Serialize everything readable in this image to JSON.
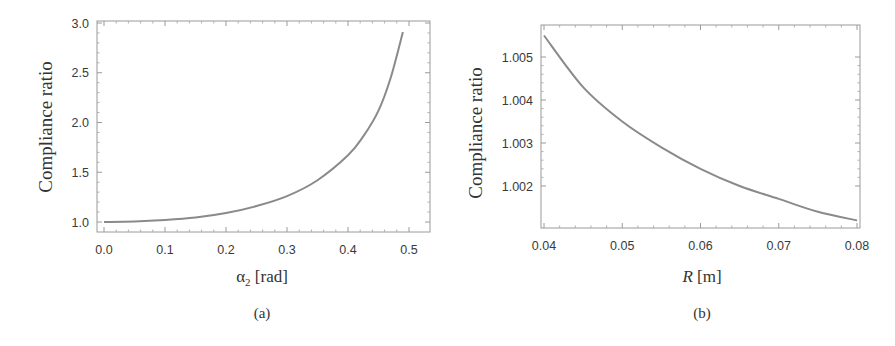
{
  "colors": {
    "curve": "#8a8a8a",
    "frame": "#9a9a9a",
    "text": "#333333",
    "background": "#ffffff"
  },
  "chart_data": [
    {
      "id": "a",
      "type": "line",
      "caption": "(a)",
      "title": "",
      "xlabel": "α₂ [rad]",
      "xlabel_base": "α",
      "xlabel_sub": "2",
      "xlabel_unit": " [rad]",
      "ylabel": "Compliance ratio",
      "xlim": [
        -0.01,
        0.535
      ],
      "ylim": [
        0.9,
        3.0
      ],
      "xticks": [
        "0.0",
        "0.1",
        "0.2",
        "0.3",
        "0.4",
        "0.5"
      ],
      "xtick_values": [
        0.0,
        0.1,
        0.2,
        0.3,
        0.4,
        0.5
      ],
      "yticks": [
        "1.0",
        "1.5",
        "2.0",
        "2.5",
        "3.0"
      ],
      "ytick_values": [
        1.0,
        1.5,
        2.0,
        2.5,
        3.0
      ],
      "grid": false,
      "legend": null,
      "series": [
        {
          "name": "Compliance ratio",
          "x": [
            0.0,
            0.05,
            0.1,
            0.15,
            0.2,
            0.25,
            0.3,
            0.35,
            0.4,
            0.425,
            0.45,
            0.47,
            0.49
          ],
          "y": [
            1.0,
            1.005,
            1.02,
            1.045,
            1.09,
            1.16,
            1.26,
            1.42,
            1.67,
            1.86,
            2.12,
            2.45,
            2.91
          ]
        }
      ]
    },
    {
      "id": "b",
      "type": "line",
      "caption": "(b)",
      "title": "",
      "xlabel": "R [m]",
      "xlabel_base": "R",
      "xlabel_sub": "",
      "xlabel_unit": " [m]",
      "ylabel": "Compliance ratio",
      "xlim": [
        0.0395,
        0.0805
      ],
      "ylim": [
        1.00105,
        1.00572
      ],
      "xticks": [
        "0.04",
        "0.05",
        "0.06",
        "0.07",
        "0.08"
      ],
      "xtick_values": [
        0.04,
        0.05,
        0.06,
        0.07,
        0.08
      ],
      "yticks": [
        "1.002",
        "1.003",
        "1.004",
        "1.005"
      ],
      "ytick_values": [
        1.002,
        1.003,
        1.004,
        1.005
      ],
      "grid": false,
      "legend": null,
      "series": [
        {
          "name": "Compliance ratio",
          "x": [
            0.04,
            0.045,
            0.05,
            0.055,
            0.06,
            0.065,
            0.07,
            0.075,
            0.08
          ],
          "y": [
            1.0055,
            1.0043,
            1.0035,
            1.0029,
            1.0024,
            1.002,
            1.0017,
            1.0014,
            1.0012
          ]
        }
      ]
    }
  ]
}
